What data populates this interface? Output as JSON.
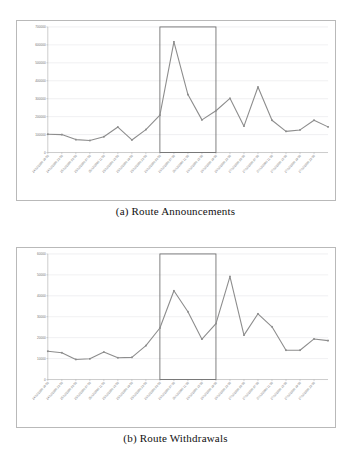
{
  "document": {
    "kind": "figure-pair",
    "background": "#ffffff"
  },
  "colors": {
    "line": "#8d8d8d",
    "grid": "#d2d2d8",
    "axis": "#9a9a9a",
    "frame": "#b9b9b9",
    "highlight": "#6a6a6a",
    "tick_text": "#6e6e6e",
    "caption_text": "#111111"
  },
  "figures": [
    {
      "id": "a",
      "caption": "(a) Route Announcements"
    },
    {
      "id": "b",
      "caption": "(b) Route Withdrawals"
    }
  ],
  "x_labels": [
    "24/12/2006 19:55",
    "24/12/2006 23:55",
    "25/12/2006 03:55",
    "25/12/2006 07:55",
    "25/12/2006 11:55",
    "25/12/2006 15:55",
    "25/12/2006 19:55",
    "25/12/2006 23:55",
    "26/12/2006 03:55",
    "26/12/2006 07:55",
    "26/12/2006 11:55",
    "26/12/2006 15:55",
    "26/12/2006 19:55",
    "26/12/2006 23:55",
    "27/12/2006 03:55",
    "27/12/2006 07:55",
    "27/12/2006 11:55",
    "27/12/2006 15:55",
    "27/12/2006 19:55",
    "27/12/2006 23:55"
  ],
  "chart_data": [
    {
      "type": "line",
      "id": "route-announcements",
      "title": "(a) Route Announcements",
      "xlabel": "",
      "ylabel": "",
      "ylim": [
        0,
        700000
      ],
      "yticks": [
        0,
        100000,
        200000,
        300000,
        400000,
        500000,
        600000,
        700000
      ],
      "ytick_labels": [
        "0",
        "100000",
        "200000",
        "300000",
        "400000",
        "500000",
        "600000",
        "700000"
      ],
      "grid": true,
      "legend": "none",
      "categories": [
        "24/12/2006 19:55",
        "24/12/2006 23:55",
        "25/12/2006 03:55",
        "25/12/2006 07:55",
        "25/12/2006 11:55",
        "25/12/2006 15:55",
        "25/12/2006 19:55",
        "25/12/2006 23:55",
        "26/12/2006 03:55",
        "26/12/2006 07:55",
        "26/12/2006 11:55",
        "26/12/2006 15:55",
        "26/12/2006 19:55",
        "26/12/2006 23:55",
        "27/12/2006 03:55",
        "27/12/2006 07:55",
        "27/12/2006 11:55",
        "27/12/2006 15:55",
        "27/12/2006 19:55",
        "27/12/2006 23:55"
      ],
      "values": [
        102000,
        100000,
        72000,
        67000,
        88000,
        142000,
        70000,
        128000,
        208000,
        617000,
        323000,
        182000,
        233000,
        302000,
        147000,
        365000,
        180000,
        118000,
        126000,
        180000,
        143000
      ],
      "annotations": [
        {
          "kind": "highlight-rectangle",
          "from_index": 8,
          "to_index": 12,
          "y_from": 0,
          "y_to": 700000
        }
      ]
    },
    {
      "type": "line",
      "id": "route-withdrawals",
      "title": "(b) Route Withdrawals",
      "xlabel": "",
      "ylabel": "",
      "ylim": [
        0,
        60000
      ],
      "yticks": [
        0,
        10000,
        20000,
        30000,
        40000,
        50000,
        60000
      ],
      "ytick_labels": [
        "0",
        "10000",
        "20000",
        "30000",
        "40000",
        "50000",
        "60000"
      ],
      "grid": true,
      "legend": "none",
      "categories": [
        "24/12/2006 19:55",
        "24/12/2006 23:55",
        "25/12/2006 03:55",
        "25/12/2006 07:55",
        "25/12/2006 11:55",
        "25/12/2006 15:55",
        "25/12/2006 19:55",
        "25/12/2006 23:55",
        "26/12/2006 03:55",
        "26/12/2006 07:55",
        "26/12/2006 11:55",
        "26/12/2006 15:55",
        "26/12/2006 19:55",
        "26/12/2006 23:55",
        "27/12/2006 03:55",
        "27/12/2006 07:55",
        "27/12/2006 11:55",
        "27/12/2006 15:55",
        "27/12/2006 19:55",
        "27/12/2006 23:55"
      ],
      "values": [
        13500,
        12800,
        9600,
        9900,
        13100,
        10400,
        10600,
        16200,
        24600,
        42400,
        32400,
        19300,
        26700,
        49200,
        21200,
        31400,
        25200,
        14000,
        14000,
        19400,
        18600
      ],
      "annotations": [
        {
          "kind": "highlight-rectangle",
          "from_index": 8,
          "to_index": 12,
          "y_from": 0,
          "y_to": 60000
        }
      ]
    }
  ]
}
